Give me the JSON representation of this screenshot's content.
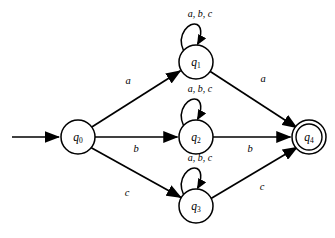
{
  "diagram": {
    "type": "finite-state-automaton",
    "title": "",
    "background_color": "#ffffff",
    "stroke_color": "#000000",
    "alphabet": [
      "a",
      "b",
      "c"
    ],
    "start_state": "q0",
    "accepting_states": [
      "q4"
    ],
    "states": [
      {
        "id": "q0",
        "letter": "q",
        "subscript": "0",
        "cx": 78,
        "cy": 137,
        "r": 17,
        "accepting": false
      },
      {
        "id": "q1",
        "letter": "q",
        "subscript": "1",
        "cx": 196,
        "cy": 62,
        "r": 17,
        "accepting": false
      },
      {
        "id": "q2",
        "letter": "q",
        "subscript": "2",
        "cx": 196,
        "cy": 137,
        "r": 17,
        "accepting": false
      },
      {
        "id": "q3",
        "letter": "q",
        "subscript": "3",
        "cx": 196,
        "cy": 206,
        "r": 17,
        "accepting": false
      },
      {
        "id": "q4",
        "letter": "q",
        "subscript": "4",
        "cx": 309,
        "cy": 137,
        "r": 17,
        "accepting": true,
        "inner_r": 13
      }
    ],
    "start_arrow": {
      "name": "start-arrow",
      "x1": 12,
      "y1": 137,
      "x2": 60,
      "y2": 137
    },
    "transitions": [
      {
        "from": "q0",
        "to": "q1",
        "label": "a",
        "label_x": 128,
        "label_y": 82
      },
      {
        "from": "q0",
        "to": "q2",
        "label": "b",
        "label_x": 136,
        "label_y": 150
      },
      {
        "from": "q0",
        "to": "q3",
        "label": "c",
        "label_x": 127,
        "label_y": 194
      },
      {
        "from": "q1",
        "to": "q4",
        "label": "a",
        "label_x": 263,
        "label_y": 80
      },
      {
        "from": "q2",
        "to": "q4",
        "label": "b",
        "label_x": 250,
        "label_y": 150
      },
      {
        "from": "q3",
        "to": "q4",
        "label": "c",
        "label_x": 262,
        "label_y": 188
      }
    ],
    "self_loops": [
      {
        "state": "q1",
        "label": "a, b, c",
        "label_x": 200,
        "label_y": 15
      },
      {
        "state": "q2",
        "label": "a, b, c",
        "label_x": 200,
        "label_y": 90
      },
      {
        "state": "q3",
        "label": "a, b, c",
        "label_x": 200,
        "label_y": 159
      }
    ]
  }
}
